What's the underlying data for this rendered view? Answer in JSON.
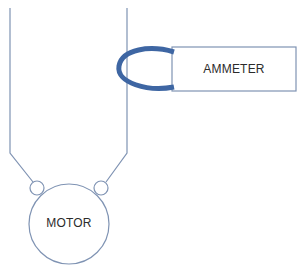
{
  "diagram": {
    "type": "clamp-on ammeter measurement schematic",
    "motor": {
      "label": "MOTOR"
    },
    "ammeter": {
      "label": "AMMETER"
    },
    "components": [
      {
        "name": "motor",
        "shape": "circle",
        "label": "MOTOR"
      },
      {
        "name": "ammeter",
        "shape": "rectangle",
        "label": "AMMETER"
      },
      {
        "name": "left-terminal",
        "shape": "small circle"
      },
      {
        "name": "right-terminal",
        "shape": "small circle"
      },
      {
        "name": "left-wire",
        "shape": "line"
      },
      {
        "name": "right-wire",
        "shape": "line"
      },
      {
        "name": "clamp-jaw",
        "shape": "thick ellipse ring around right wire"
      }
    ],
    "connections": [
      {
        "from": "left-wire",
        "to": "left-terminal"
      },
      {
        "from": "right-wire",
        "to": "right-terminal"
      },
      {
        "from": "clamp-jaw",
        "to": "ammeter",
        "note": "clamp encircles right wire"
      }
    ],
    "colors": {
      "line": "#7f93b3",
      "clamp": "#3e66a3",
      "text": "#2b2b2b",
      "background": "#ffffff"
    }
  }
}
